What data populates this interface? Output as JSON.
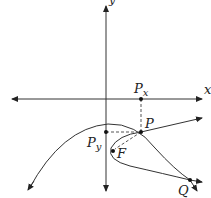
{
  "diagram": {
    "type": "geometric-construction",
    "colors": {
      "stroke": "#333333",
      "dashed": "#555555",
      "background": "#ffffff"
    },
    "axes": {
      "x_label": "x",
      "y_label": "y"
    },
    "points": {
      "P": {
        "label": "P",
        "x": 141,
        "y": 132
      },
      "Px": {
        "label": "P",
        "sub": "x",
        "x": 141,
        "y": 99
      },
      "Py": {
        "label": "P",
        "sub": "y",
        "x": 106,
        "y": 132
      },
      "F": {
        "label": "F",
        "x": 113,
        "y": 151
      },
      "Q": {
        "label": "Q",
        "x": 190,
        "y": 180
      }
    }
  }
}
